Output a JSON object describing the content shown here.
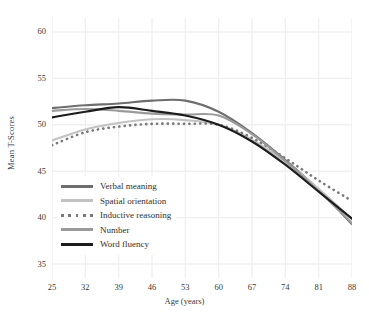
{
  "chart_data": {
    "type": "line",
    "title": "",
    "xlabel": "Age (years)",
    "ylabel": "Mean T-Scores",
    "x": [
      25,
      32,
      39,
      46,
      53,
      60,
      67,
      74,
      81,
      88
    ],
    "xticklabels": [
      "25",
      "32",
      "39",
      "46",
      "53",
      "60",
      "67",
      "74",
      "81",
      "88"
    ],
    "yticklabels": [
      "35",
      "40",
      "45",
      "50",
      "55",
      "60"
    ],
    "yticks": [
      35,
      40,
      45,
      50,
      55,
      60
    ],
    "xlim": [
      25,
      88
    ],
    "ylim": [
      33.5,
      61.5
    ],
    "grid": true,
    "legend_position": "lower-left-inside",
    "series": [
      {
        "name": "Verbal meaning",
        "color": "#6e6e6e",
        "style": "solid",
        "values": [
          51.8,
          52.1,
          52.3,
          52.6,
          52.6,
          51.4,
          49.1,
          46.2,
          43.0,
          39.3
        ]
      },
      {
        "name": "Spatial orientation",
        "color": "#c2c2c2",
        "style": "solid",
        "values": [
          48.3,
          49.5,
          50.2,
          50.6,
          50.5,
          50.0,
          48.4,
          46.0,
          43.1,
          39.8
        ]
      },
      {
        "name": "Inductive reasoning",
        "color": "#7a7a7a",
        "style": "dotted",
        "values": [
          47.8,
          49.2,
          49.8,
          50.1,
          50.1,
          50.0,
          48.6,
          46.4,
          44.0,
          41.8
        ]
      },
      {
        "name": "Number",
        "color": "#9a9a9a",
        "style": "solid",
        "values": [
          51.5,
          51.7,
          51.5,
          51.2,
          51.1,
          51.0,
          49.0,
          46.1,
          42.9,
          39.4
        ]
      },
      {
        "name": "Word fluency",
        "color": "#1c1c1c",
        "style": "solid",
        "values": [
          50.8,
          51.4,
          51.9,
          51.5,
          51.0,
          50.0,
          48.2,
          45.7,
          42.8,
          39.9
        ]
      }
    ]
  },
  "legend": {
    "items": [
      {
        "label": "Verbal meaning"
      },
      {
        "label": "Spatial orientation"
      },
      {
        "label": "Inductive reasoning"
      },
      {
        "label": "Number"
      },
      {
        "label": "Word fluency"
      }
    ]
  },
  "colors": {
    "background": "#ffffff",
    "grid": "#f0f0f0",
    "text": "#3a3a3a"
  }
}
